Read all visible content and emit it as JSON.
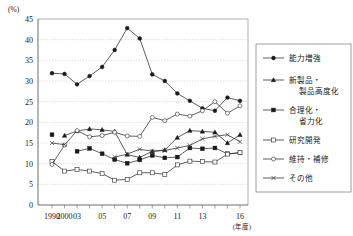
{
  "chart_data": {
    "type": "line",
    "title": "",
    "xlabel": "(年度)",
    "ylabel": "(%)",
    "ylim": [
      0,
      45
    ],
    "ytick_labels": [
      "0",
      "5",
      "10",
      "15",
      "20",
      "25",
      "30",
      "35",
      "40",
      "45"
    ],
    "ytick_values": [
      0,
      5,
      10,
      15,
      20,
      25,
      30,
      35,
      40,
      45
    ],
    "grid": true,
    "legend_position": "right",
    "x": [
      "1990",
      "2000",
      "03",
      "04",
      "05",
      "06",
      "07",
      "08",
      "09",
      "10",
      "11",
      "12",
      "13",
      "14",
      "15",
      "16"
    ],
    "xtick_labels": [
      "1990",
      "2000",
      "03",
      "05",
      "07",
      "09",
      "11",
      "13",
      "16"
    ],
    "xtick_index": [
      0,
      1,
      2,
      4,
      6,
      8,
      10,
      12,
      15
    ],
    "series": [
      {
        "name": "能力増強",
        "marker": "filled-circle",
        "values": [
          31.9,
          31.7,
          29.2,
          31.2,
          33.4,
          37.5,
          42.8,
          40.3,
          31.6,
          30.0,
          27.0,
          25.2,
          23.4,
          22.8,
          26.0,
          25.2
        ]
      },
      {
        "name": "新製品・製品高度化",
        "marker": "filled-triangle",
        "values": [
          null,
          16.8,
          17.9,
          18.4,
          18.2,
          17.8,
          12.2,
          11.5,
          13.0,
          13.3,
          16.3,
          18.0,
          17.8,
          17.6,
          15.0,
          17.0
        ]
      },
      {
        "name": "合理化・省力化",
        "marker": "filled-square",
        "values": [
          17.0,
          null,
          13.0,
          13.7,
          12.4,
          11.0,
          10.1,
          10.9,
          12.0,
          11.4,
          11.6,
          13.8,
          13.6,
          13.8,
          12.4,
          12.6
        ]
      },
      {
        "name": "研究開発",
        "marker": "open-square",
        "values": [
          10.5,
          8.2,
          8.6,
          8.2,
          7.6,
          6.0,
          6.2,
          7.8,
          7.8,
          7.4,
          9.7,
          10.6,
          10.5,
          10.4,
          12.3,
          12.7
        ]
      },
      {
        "name": "維持・補修",
        "marker": "open-circle",
        "values": [
          9.8,
          14.5,
          18.0,
          16.5,
          16.8,
          17.6,
          16.7,
          16.6,
          21.2,
          20.4,
          22.0,
          21.5,
          22.8,
          25.0,
          22.2,
          24.0
        ]
      },
      {
        "name": "その他",
        "marker": "x-cross",
        "values": [
          15.0,
          14.6,
          null,
          null,
          null,
          11.6,
          12.3,
          13.5,
          13.0,
          13.2,
          13.8,
          14.4,
          16.0,
          16.6,
          17.0,
          15.3
        ]
      }
    ]
  },
  "legend": {
    "items": [
      {
        "label": "能力増強",
        "label2": ""
      },
      {
        "label": "新製品・",
        "label2": "製品高度化"
      },
      {
        "label": "合理化・",
        "label2": "省力化"
      },
      {
        "label": "研究開発",
        "label2": ""
      },
      {
        "label": "維持・補修",
        "label2": ""
      },
      {
        "label": "その他",
        "label2": ""
      }
    ]
  },
  "axes": {
    "y_unit": "(%)",
    "x_unit": "(年度)"
  },
  "colors": {
    "ink": "#1a1a1a",
    "grid": "#b9b9b9",
    "frame": "#8a8a8a"
  }
}
